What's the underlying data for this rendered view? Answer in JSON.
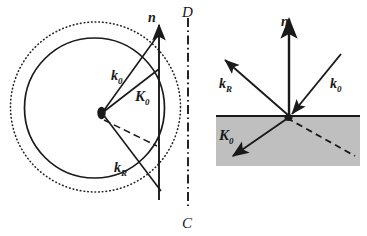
{
  "figure": {
    "background_color": "#ffffff",
    "stroke_color": "#1a1a1a",
    "medium_fill": "#bfbfbf",
    "width": 367,
    "height": 236
  },
  "left_panel": {
    "name": "ewald-sphere-construction",
    "origin": {
      "x": 102,
      "y": 113
    },
    "circles": [
      {
        "kind": "solid",
        "cx": 94.5,
        "cy": 108,
        "r": 70,
        "style": "solid"
      },
      {
        "kind": "dotted",
        "cx": 95.5,
        "cy": 107,
        "r": 85,
        "style": "dotted"
      }
    ],
    "surface_normal": {
      "label": "n",
      "x": 159,
      "y_top": 22,
      "y_bottom": 200
    },
    "axis_line": {
      "label_top": "D",
      "label_bottom": "C",
      "x": 188,
      "y_top": 18,
      "y_bottom": 206,
      "style": "dash-dot"
    },
    "vectors": [
      {
        "label": "k",
        "subscript": "0",
        "from": {
          "x": 102,
          "y": 113
        },
        "to": {
          "x": 161,
          "y": 31
        },
        "label_pos": {
          "x": 117,
          "y": 79
        }
      },
      {
        "label": "K",
        "subscript": "0",
        "from": {
          "x": 102,
          "y": 113
        },
        "to": {
          "x": 159,
          "y": 69
        },
        "label_pos": {
          "x": 141,
          "y": 99
        }
      },
      {
        "label": "k",
        "subscript": "R",
        "from": {
          "x": 102,
          "y": 113
        },
        "to": {
          "x": 161,
          "y": 191
        },
        "label_pos": {
          "x": 120,
          "y": 170
        }
      }
    ],
    "dashed_ray": {
      "from": {
        "x": 104,
        "y": 120
      },
      "to": {
        "x": 157,
        "y": 146
      }
    }
  },
  "right_panel": {
    "name": "reflection-refraction-diagram",
    "interface_y": 116,
    "medium": {
      "x": 216,
      "y": 116,
      "width": 144,
      "height": 50
    },
    "incidence_point": {
      "x": 289,
      "y": 117
    },
    "surface_normal": {
      "label": "n",
      "x": 289,
      "y_top": 16,
      "y_bottom": 117
    },
    "vectors": [
      {
        "label": "k",
        "subscript": "0",
        "from": {
          "x": 341,
          "y": 54
        },
        "to": {
          "x": 291,
          "y": 115
        },
        "label_pos": {
          "x": 340,
          "y": 83
        },
        "direction": "incoming"
      },
      {
        "label": "k",
        "subscript": "R",
        "from": {
          "x": 289,
          "y": 115
        },
        "to": {
          "x": 224,
          "y": 59
        },
        "label_pos": {
          "x": 226,
          "y": 83
        },
        "direction": "outgoing"
      },
      {
        "label": "K",
        "subscript": "0",
        "from": {
          "x": 288,
          "y": 118
        },
        "to": {
          "x": 232,
          "y": 157
        },
        "label_pos": {
          "x": 222,
          "y": 140
        },
        "direction": "transmitted"
      }
    ],
    "dashed_ray": {
      "from": {
        "x": 287,
        "y": 118
      },
      "to": {
        "x": 355,
        "y": 156
      }
    }
  },
  "labels": {
    "n": "n",
    "k": "k",
    "K": "K",
    "sub_zero": "0",
    "sub_R": "R",
    "point_D": "D",
    "point_C": "C"
  }
}
